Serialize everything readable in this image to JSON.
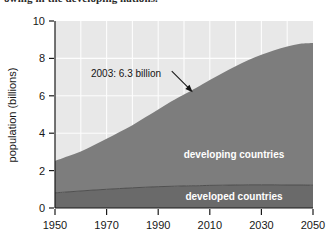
{
  "figure": {
    "name": "world-population-growth-chart",
    "caption_bleed_text": "owing in the developing nations."
  },
  "chart_data": {
    "type": "area",
    "stacked": true,
    "title": "",
    "xlabel": "",
    "ylabel": "population (billions)",
    "xlim": [
      1950,
      2050
    ],
    "ylim": [
      0,
      10
    ],
    "xticks": [
      1950,
      1970,
      1990,
      2010,
      2030,
      2050
    ],
    "xtick_labels": [
      "1950",
      "1970",
      "1990",
      "2010",
      "2030",
      "2050"
    ],
    "yticks": [
      0,
      2,
      4,
      6,
      8,
      10
    ],
    "ytick_labels": [
      "0",
      "2",
      "4",
      "6",
      "8",
      "10"
    ],
    "grid": true,
    "grid_x_values": [
      1960,
      1970,
      1980,
      1990,
      2000,
      2010,
      2020,
      2030,
      2040
    ],
    "grid_y_values": [
      2,
      4,
      6,
      8
    ],
    "legend_position": "inline-labels",
    "x": [
      1950,
      1955,
      1960,
      1965,
      1970,
      1975,
      1980,
      1985,
      1990,
      1995,
      2000,
      2003,
      2005,
      2010,
      2015,
      2020,
      2025,
      2030,
      2035,
      2040,
      2045,
      2050
    ],
    "series": [
      {
        "name": "developed countries",
        "label": "developed countries",
        "color": "#6a6a6a",
        "values": [
          0.81,
          0.86,
          0.91,
          0.96,
          1.0,
          1.04,
          1.08,
          1.11,
          1.14,
          1.16,
          1.18,
          1.19,
          1.19,
          1.21,
          1.22,
          1.23,
          1.24,
          1.24,
          1.24,
          1.23,
          1.23,
          1.22
        ]
      },
      {
        "name": "developing countries",
        "label": "developing countries",
        "color": "#7d7d7d",
        "values": [
          1.71,
          1.91,
          2.11,
          2.39,
          2.7,
          3.03,
          3.35,
          3.74,
          4.13,
          4.53,
          4.89,
          5.11,
          5.26,
          5.64,
          6.0,
          6.35,
          6.67,
          6.95,
          7.2,
          7.4,
          7.55,
          7.6
        ]
      }
    ],
    "totals": [
      2.52,
      2.77,
      3.02,
      3.35,
      3.7,
      4.07,
      4.43,
      4.85,
      5.27,
      5.69,
      6.07,
      6.3,
      6.45,
      6.85,
      7.22,
      7.58,
      7.91,
      8.19,
      8.44,
      8.63,
      8.78,
      8.82
    ],
    "annotations": [
      {
        "name": "population-2003-annotation",
        "text": "2003: 6.3 billion",
        "year": 2003,
        "value": 6.3,
        "arrow": true
      }
    ],
    "colors": {
      "plot_background": "#e8e8e8",
      "gridline": "#fdfdfd",
      "developing_fill": "#7d7d7d",
      "developed_fill": "#6a6a6a",
      "axis": "#1a1a1a",
      "text": "#141414"
    }
  }
}
